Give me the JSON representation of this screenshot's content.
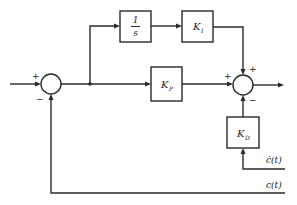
{
  "diagram": {
    "type": "block-diagram",
    "title": "",
    "blocks": {
      "integrator": {
        "numerator": "1",
        "denominator": "s"
      },
      "ki": {
        "main": "K",
        "sub": "I"
      },
      "kp": {
        "main": "K",
        "sub": "P"
      },
      "kd": {
        "main": "K",
        "sub": "D"
      }
    },
    "junctions": {
      "left": {
        "sign_in": "+",
        "sign_feedback": "−"
      },
      "right": {
        "sign_kp": "+",
        "sign_ki": "+",
        "sign_kd": "−"
      }
    },
    "signals": {
      "c_dot": "ċ(t)",
      "c": "c(t)"
    },
    "colors": {
      "line": "#2a2a2a",
      "background": "#ffffff"
    }
  }
}
